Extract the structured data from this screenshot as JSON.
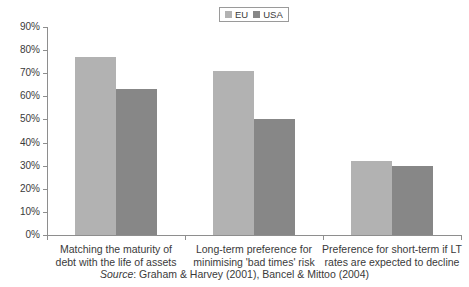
{
  "chart_data": {
    "type": "bar",
    "title": "",
    "subtitle": "",
    "xlabel": "",
    "ylabel": "",
    "ylim": [
      0,
      90
    ],
    "ytick_step": 10,
    "grid": false,
    "legend_position": "top-center",
    "categories": [
      "Matching the maturity of debt with the life of assets",
      "Long-term preference for minimising 'bad times' risk",
      "Preference for short-term if LT rates are expected to decline"
    ],
    "category_lines": [
      [
        "Matching the maturity of",
        "debt with the life of assets"
      ],
      [
        "Long-term preference for",
        "minimising 'bad times' risk"
      ],
      [
        "Preference for short-term if LT",
        "rates are expected to decline"
      ]
    ],
    "series": [
      {
        "name": "EU",
        "color": "#b2b2b2",
        "values": [
          77,
          71,
          32
        ]
      },
      {
        "name": "USA",
        "color": "#878787",
        "values": [
          63,
          50,
          30
        ]
      }
    ],
    "ytick_labels": [
      "0%",
      "10%",
      "20%",
      "30%",
      "40%",
      "50%",
      "60%",
      "70%",
      "80%",
      "90%"
    ],
    "ytick_values": [
      0,
      10,
      20,
      30,
      40,
      50,
      60,
      70,
      80,
      90
    ],
    "source": {
      "prefix": "Source",
      "text": ": Graham & Harvey (2001), Bancel & Mittoo (2004)"
    }
  },
  "legend": {
    "items": [
      {
        "label": "EU",
        "color": "#b2b2b2"
      },
      {
        "label": "USA",
        "color": "#878787"
      }
    ]
  }
}
